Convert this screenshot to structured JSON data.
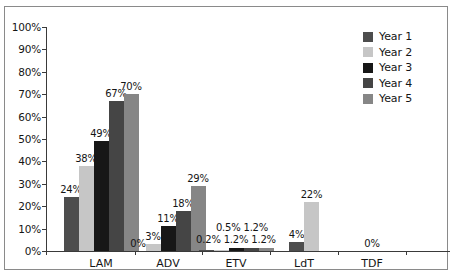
{
  "chart_data": {
    "type": "bar",
    "title": "",
    "subtitle": "",
    "xlabel": "",
    "ylabel": "",
    "ylim": [
      0,
      100
    ],
    "ytick_labels": [
      "100%",
      "90%",
      "80%",
      "70%",
      "60%",
      "50%",
      "40%",
      "30%",
      "20%",
      "10%",
      "0%"
    ],
    "ytick_values": [
      100,
      90,
      80,
      70,
      60,
      50,
      40,
      30,
      20,
      10,
      0
    ],
    "grid": false,
    "legend_position": "top-right",
    "categories": [
      "LAM",
      "ADV",
      "ETV",
      "LdT",
      "TDF"
    ],
    "series": [
      {
        "name": "Year 1",
        "color": "#4d4d4d",
        "values": [
          24,
          0,
          0.2,
          4,
          0
        ]
      },
      {
        "name": "Year 2",
        "color": "#c6c6c6",
        "values": [
          38,
          3,
          0.5,
          22,
          0
        ]
      },
      {
        "name": "Year 3",
        "color": "#171717",
        "values": [
          49,
          11,
          1.2,
          null,
          null
        ]
      },
      {
        "name": "Year 4",
        "color": "#454545",
        "values": [
          67,
          18,
          1.2,
          null,
          null
        ]
      },
      {
        "name": "Year 5",
        "color": "#868686",
        "values": [
          70,
          29,
          1.2,
          null,
          null
        ]
      }
    ],
    "groups": [
      {
        "category": "LAM",
        "bars": [
          {
            "series": "Year 1",
            "value": 24,
            "label": "24%",
            "color": "#4d4d4d"
          },
          {
            "series": "Year 2",
            "value": 38,
            "label": "38%",
            "color": "#c6c6c6"
          },
          {
            "series": "Year 3",
            "value": 49,
            "label": "49%",
            "color": "#171717"
          },
          {
            "series": "Year 4",
            "value": 67,
            "label": "67%",
            "color": "#454545"
          },
          {
            "series": "Year 5",
            "value": 70,
            "label": "70%",
            "color": "#868686"
          }
        ]
      },
      {
        "category": "ADV",
        "bars": [
          {
            "series": "Year 1",
            "value": 0,
            "label": "0%",
            "color": "#4d4d4d"
          },
          {
            "series": "Year 2",
            "value": 3,
            "label": "3%",
            "color": "#c6c6c6"
          },
          {
            "series": "Year 3",
            "value": 11,
            "label": "11%",
            "color": "#171717"
          },
          {
            "series": "Year 4",
            "value": 18,
            "label": "18%",
            "color": "#454545"
          },
          {
            "series": "Year 5",
            "value": 29,
            "label": "29%",
            "color": "#868686"
          }
        ]
      },
      {
        "category": "ETV",
        "bars": [
          {
            "series": "Year 1",
            "value": 0.2,
            "label": "0.2%",
            "color": "#4d4d4d"
          },
          {
            "series": "Year 2",
            "value": 0.5,
            "label": "0.5%",
            "color": "#c6c6c6"
          },
          {
            "series": "Year 3",
            "value": 1.2,
            "label": "1.2%",
            "color": "#171717"
          },
          {
            "series": "Year 4",
            "value": 1.2,
            "label": "1.2%",
            "color": "#454545"
          },
          {
            "series": "Year 5",
            "value": 1.2,
            "label": "1.2%",
            "color": "#868686"
          }
        ],
        "label_rows": {
          "upper": "0.5%  1.2%",
          "lower": "0.2%  1.2%  1.2%"
        }
      },
      {
        "category": "LdT",
        "bars": [
          {
            "series": "Year 1",
            "value": 4,
            "label": "4%",
            "color": "#4d4d4d"
          },
          {
            "series": "Year 2",
            "value": 22,
            "label": "22%",
            "color": "#c6c6c6"
          }
        ]
      },
      {
        "category": "TDF",
        "bars": [
          {
            "series": "Year 1",
            "value": 0,
            "label": "0%",
            "color": "#4d4d4d"
          }
        ]
      }
    ]
  },
  "legend": {
    "items": [
      {
        "label": "Year 1",
        "color": "#4d4d4d"
      },
      {
        "label": "Year 2",
        "color": "#c6c6c6"
      },
      {
        "label": "Year 3",
        "color": "#171717"
      },
      {
        "label": "Year 4",
        "color": "#454545"
      },
      {
        "label": "Year 5",
        "color": "#868686"
      }
    ]
  },
  "axis": {
    "y_ticks": [
      "100%",
      "90%",
      "80%",
      "70%",
      "60%",
      "50%",
      "40%",
      "30%",
      "20%",
      "10%",
      "0%"
    ],
    "x_categories": [
      "LAM",
      "ADV",
      "ETV",
      "LdT",
      "TDF"
    ]
  }
}
